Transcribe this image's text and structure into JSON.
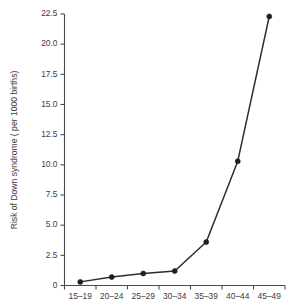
{
  "chart_data": {
    "type": "line",
    "title": "",
    "xlabel": "",
    "ylabel": "Risk of Down syndrome ( per 1000 births)",
    "categories": [
      "15–19",
      "20–24",
      "25–29",
      "30–34",
      "35–39",
      "40–44",
      "45–49"
    ],
    "values": [
      0.3,
      0.7,
      1.0,
      1.2,
      3.6,
      10.3,
      22.3
    ],
    "series": [
      {
        "name": "Risk of Down syndrome",
        "values": [
          0.3,
          0.7,
          1.0,
          1.2,
          3.6,
          10.3,
          22.3
        ]
      }
    ],
    "ylim": [
      0,
      22.5
    ],
    "yticks": [
      0,
      2.5,
      5.0,
      7.5,
      10.0,
      12.5,
      15.0,
      17.5,
      20.0,
      22.5
    ],
    "ytick_labels": [
      "0",
      "2.5",
      "5.0",
      "7.5",
      "10.0",
      "12.5",
      "15.0",
      "17.5",
      "20.0",
      "22.5"
    ],
    "xtick_labels": [
      "15–19",
      "20–24",
      "25–29",
      "30–34",
      "35–39",
      "40–44",
      "45–49"
    ],
    "grid": false,
    "legend": null,
    "legend_position": "none",
    "marker": "circle",
    "line_color": "#2b2b2b",
    "marker_color": "#1f1f1f",
    "axis_color": "#4a4a4a",
    "background_color": "#ffffff",
    "annotations": []
  }
}
